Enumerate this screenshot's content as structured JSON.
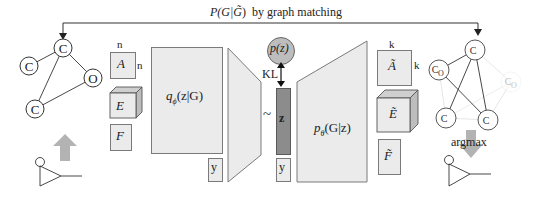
{
  "title": {
    "text": "P(G|G̃)  by graph matching",
    "p_part": "P(G|",
    "g_tilde": "G̃",
    "close": ")",
    "suffix": "by graph matching"
  },
  "input_graph": {
    "nodes": [
      {
        "id": "n1",
        "label": "C"
      },
      {
        "id": "n2",
        "label": "C"
      },
      {
        "id": "n3",
        "label": "O"
      },
      {
        "id": "n4",
        "label": "C"
      }
    ]
  },
  "encoder_inputs": {
    "dim_top": "n",
    "dim_side": "n",
    "adjacency": "A",
    "edges": "E",
    "features": "F"
  },
  "encoder": {
    "label_q": "q",
    "label_sub": "ϕ",
    "label_rest": "(z|G)",
    "condition": "y"
  },
  "latent": {
    "prior": "p(z)",
    "kl": "KL",
    "tilde": "~",
    "z": "z",
    "condition": "y"
  },
  "decoder": {
    "label_p": "p",
    "label_sub": "θ",
    "label_rest": "(G|z)"
  },
  "decoder_outputs": {
    "dim_top": "k",
    "dim_side": "k",
    "adjacency": "Ã",
    "edges": "Ẽ",
    "features": "F̃"
  },
  "output_graph": {
    "nodes": [
      {
        "id": "m1",
        "label": "C"
      },
      {
        "id": "m2",
        "label": "C",
        "sub": "O"
      },
      {
        "id": "m3",
        "label": "C",
        "sub": "O"
      },
      {
        "id": "m4",
        "label": "C"
      },
      {
        "id": "m5",
        "label": "C"
      }
    ]
  },
  "argmax_label": "argmax",
  "colors": {
    "box_fill": "#ebebeb",
    "box_stroke": "#7a7a7a",
    "latent_fill": "#8c8c8c",
    "prior_fill": "#bdbdbd",
    "arrow_fill": "#b3b3b3",
    "faint": "#d9d9d9"
  }
}
